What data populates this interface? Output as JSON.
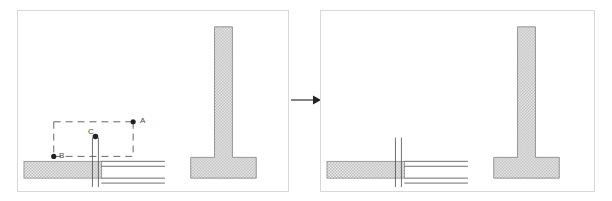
{
  "figure": {
    "type": "engineering-detail-drawing",
    "panel_count": 2,
    "background_color": "#ffffff",
    "frame_color": "#d8d8d8"
  },
  "colors": {
    "line": "#4a4a4a",
    "hatch_fill": "#b0b0b0",
    "hatch_outline": "#8a8a8a",
    "dashed_guide": "#555555",
    "node_dot": "#222222",
    "arrow": "#333333",
    "panel_border": "#d8d8d8"
  },
  "panels": [
    {
      "id": "panel-before",
      "name": "before-panel",
      "has_annotation_box": true,
      "annotation": {
        "box_style": "dashed",
        "nodes": [
          {
            "id": "A",
            "label": "A",
            "x": 116,
            "y": 112,
            "label_x": 122,
            "label_y": 108
          },
          {
            "id": "B",
            "label": "B",
            "x": 53,
            "y": 147,
            "label_x": 43,
            "label_y": 143
          },
          {
            "id": "C",
            "label": "C",
            "x": 91,
            "y": 127,
            "label_x": 82,
            "label_y": 122
          }
        ]
      },
      "elements": {
        "slab_label": "hatched-ground-slab",
        "pipe_label": "vertical-pipe",
        "wall_label": "t-shaped-wall-footing"
      }
    },
    {
      "id": "panel-after",
      "name": "after-panel",
      "has_annotation_box": false,
      "elements": {
        "slab_label": "hatched-ground-slab",
        "pipe_label": "vertical-pipe",
        "wall_label": "t-shaped-wall-footing"
      }
    }
  ],
  "transition": {
    "name": "arrow-right",
    "direction": "right",
    "label": ""
  },
  "labels": {
    "a": "A",
    "b": "B",
    "c": "C"
  }
}
